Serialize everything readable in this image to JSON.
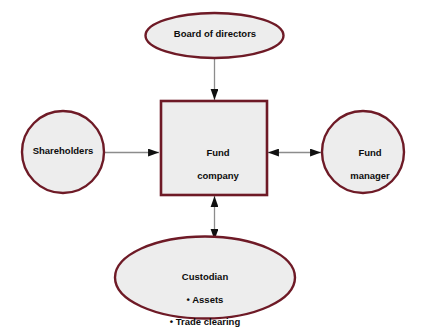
{
  "diagram": {
    "background_color": "#ffffff",
    "shape_fill": "#ededed",
    "shape_stroke": "#6e1a26",
    "connector_color": "#8c8c8c",
    "arrowhead_color": "#101010",
    "text_color": "#0c0c0c",
    "nodes": {
      "board": {
        "label": "Board of directors",
        "shape": "ellipse"
      },
      "shareholders": {
        "label": "Shareholders",
        "shape": "circle"
      },
      "fund_company": {
        "label": "Fund\ncompany",
        "line1": "Fund",
        "line2": "company",
        "shape": "rectangle"
      },
      "fund_manager": {
        "label": "Fund\nmanager",
        "line1": "Fund",
        "line2": "manager",
        "shape": "circle"
      },
      "custodian": {
        "label": "Custodian",
        "heading": "Custodian",
        "bullets": [
          "• Assets",
          "• Trade clearing"
        ],
        "shape": "ellipse"
      }
    },
    "connectors": [
      {
        "name": "board-to-fund-company",
        "from": "board",
        "to": "fund_company",
        "direction": "down",
        "arrowheads": "single"
      },
      {
        "name": "shareholders-to-fund-company",
        "from": "shareholders",
        "to": "fund_company",
        "direction": "right",
        "arrowheads": "single"
      },
      {
        "name": "fund-company-to-fund-manager",
        "from": "fund_company",
        "to": "fund_manager",
        "direction": "horizontal",
        "arrowheads": "double"
      },
      {
        "name": "fund-company-to-custodian",
        "from": "fund_company",
        "to": "custodian",
        "direction": "vertical",
        "arrowheads": "double"
      }
    ]
  }
}
